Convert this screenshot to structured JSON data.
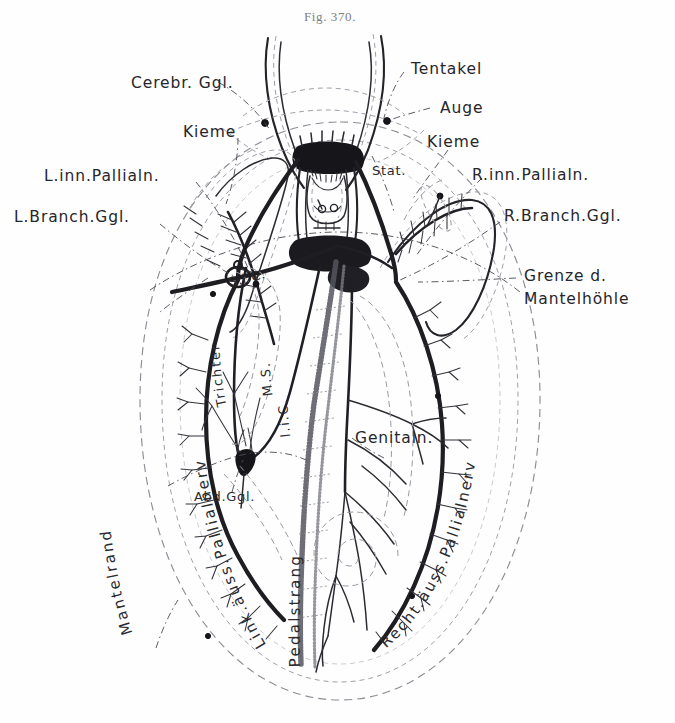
{
  "figure": {
    "caption": "Fig. 370.",
    "background_color": "#fefefe",
    "ink_color": "#1d1d22",
    "dash_color": "#8d8d96"
  },
  "labels": {
    "cerebral_ganglion": "Cerebr. Ggl.",
    "tentacle": "Tentakel",
    "eye": "Auge",
    "gill_left": "Kieme",
    "gill_right": "Kieme",
    "left_inner_pallial_nerve": "L.inn.Pallialn.",
    "right_inner_pallial_nerve": "R.inn.Pallialn.",
    "left_branchial_ganglion": "L.Branch.Ggl.",
    "right_branchial_ganglion": "R.Branch.Ggl.",
    "statocyst": "Stat.",
    "mantle_cavity_border_line1": "Grenze d.",
    "mantle_cavity_border_line2": "Mantelhöhle",
    "sic": "S.i.C.",
    "ms": "M.S.",
    "lic": "l.i.C.",
    "genital_nerve": "Genitaln.",
    "abdominal_ganglion": "Abd.Ggl.",
    "funnel": "Trichter",
    "mantle_edge": "Mantelrand",
    "left_outer_pallial_nerve": "Link.äuss.Pallialnerv",
    "right_outer_pallial_nerve": "Recht.äuss.Pallialnerv",
    "pedal_cord": "Pedalstrang"
  }
}
